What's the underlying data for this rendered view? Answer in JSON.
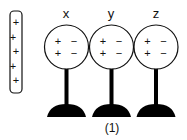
{
  "figure": {
    "caption": "(1)",
    "rod": {
      "charges": [
        "+",
        "+",
        "+",
        "+",
        "+"
      ]
    },
    "spheres": [
      {
        "label": "x",
        "charges": {
          "left_top": "+",
          "right_top": "−",
          "left_bottom": "+",
          "right_bottom": "−"
        }
      },
      {
        "label": "y",
        "charges": {
          "left_top": "+",
          "right_top": "−",
          "left_bottom": "+",
          "right_bottom": "−"
        }
      },
      {
        "label": "z",
        "charges": {
          "left_top": "+",
          "right_top": "−",
          "left_bottom": "+",
          "right_bottom": "−"
        }
      }
    ],
    "colors": {
      "stroke": "#111111",
      "fill_stand": "#000000",
      "background": "#ffffff"
    }
  }
}
